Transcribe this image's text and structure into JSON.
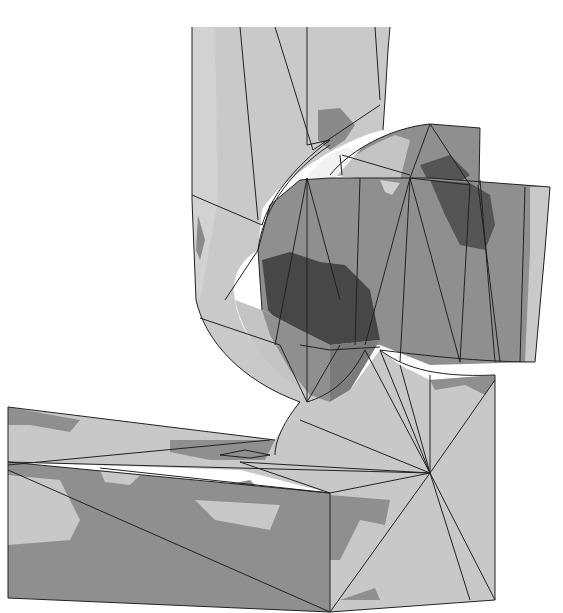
{
  "figure": {
    "colors": {
      "background": "#ffffff",
      "light": "#c8c8c8",
      "mid": "#8f8f8f",
      "dark": "#5a5a5a",
      "darkest": "#3e3e3e",
      "highlight": "#e6e6e6",
      "edge": "#222222"
    }
  }
}
